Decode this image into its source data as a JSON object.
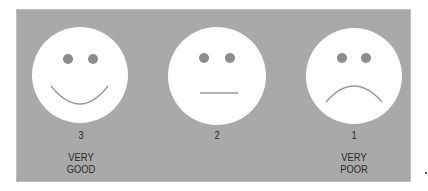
{
  "colors": {
    "panel": "#a9a9a9",
    "face": "#ffffff",
    "eye": "#8c8c8c",
    "mouth": "#9a9a9a",
    "text": "#2a2a2a"
  },
  "faces": [
    {
      "expression": "smile",
      "icon": "happy-face-icon",
      "score": "3",
      "label_line1": "VERY",
      "label_line2": "GOOD"
    },
    {
      "expression": "neutral",
      "icon": "neutral-face-icon",
      "score": "2",
      "label_line1": "",
      "label_line2": ""
    },
    {
      "expression": "frown",
      "icon": "sad-face-icon",
      "score": "1",
      "label_line1": "VERY",
      "label_line2": "POOR"
    }
  ]
}
